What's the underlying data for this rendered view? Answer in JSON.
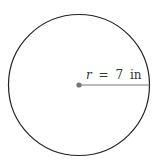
{
  "diagram": {
    "shape": "circle",
    "radius_label": "r = 7 in",
    "variable": "r",
    "value": "7",
    "unit": "in",
    "colors": {
      "outline": "#222222",
      "radius_line": "#777777",
      "center_dot": "#777777",
      "text": "#333333"
    }
  }
}
